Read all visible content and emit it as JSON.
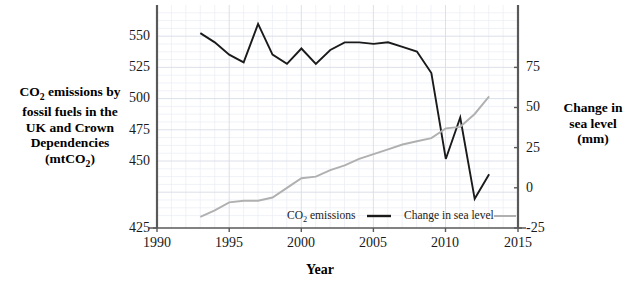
{
  "chart_data": {
    "type": "line",
    "title": "",
    "xlabel": "Year",
    "ylabel_left": "CO2 emissions by fossil fuels in the UK and Crown Dependencies (mtCO2)",
    "ylabel_right": "Change in sea level (mm)",
    "x": [
      1993,
      1994,
      1995,
      1996,
      1997,
      1998,
      1999,
      2000,
      2001,
      2002,
      2003,
      2004,
      2005,
      2006,
      2007,
      2008,
      2009,
      2010,
      2011,
      2012,
      2013
    ],
    "xlim": [
      1990,
      2015
    ],
    "xticks": [
      1990,
      1995,
      2000,
      2005,
      2010,
      2015
    ],
    "grid": true,
    "legend_position": "inside-bottom",
    "series": [
      {
        "name": "CO2 emissions",
        "axis": "left",
        "color": "#1a1a1a",
        "ylim": [
          425,
          550
        ],
        "yticks": [
          425,
          450,
          475,
          500,
          525,
          550
        ],
        "yunit": "mtCO2",
        "values": [
          552,
          546,
          538,
          533,
          558,
          538,
          532,
          542,
          532,
          541,
          546,
          546,
          545,
          546,
          543,
          540,
          526,
          470,
          497,
          444,
          460
        ]
      },
      {
        "name": "Change in sea level",
        "axis": "right",
        "color": "#b0b0b0",
        "ylim": [
          -25,
          75
        ],
        "yticks": [
          -25,
          0,
          25,
          50,
          75
        ],
        "yunit": "mm",
        "values": [
          -18,
          -14,
          -9,
          -8,
          -8,
          -6,
          0,
          6,
          7,
          11,
          14,
          18,
          21,
          24,
          27,
          29,
          31,
          37,
          38,
          46,
          57
        ]
      }
    ]
  },
  "axes": {
    "left_ticks": [
      "550",
      "525",
      "500",
      "475",
      "450",
      "425"
    ],
    "right_ticks": [
      "75",
      "50",
      "25",
      "0",
      "-25"
    ],
    "x_ticks": [
      "1990",
      "1995",
      "2000",
      "2005",
      "2010",
      "2015"
    ]
  },
  "labels": {
    "y_left_line1": "CO",
    "y_left_sub1": "2",
    "y_left_line1b": " emissions by",
    "y_left_line2": "fossil fuels in the",
    "y_left_line3": "UK and Crown",
    "y_left_line4": "Dependencies",
    "y_left_line5a": "(mtCO",
    "y_left_sub2": "2",
    "y_left_line5b": ")",
    "y_right_line1": "Change in",
    "y_right_line2": "sea level",
    "y_right_line3": "(mm)",
    "x_axis_title": "Year"
  },
  "legend": {
    "item1_a": "CO",
    "item1_sub": "2",
    "item1_b": " emissions",
    "item2": "Change in sea level"
  },
  "colors": {
    "co2_line": "#1a1a1a",
    "sea_line": "#b0b0b0",
    "axis": "#595959",
    "grid": "#e3e6ef",
    "text": "#1a1a1a"
  }
}
